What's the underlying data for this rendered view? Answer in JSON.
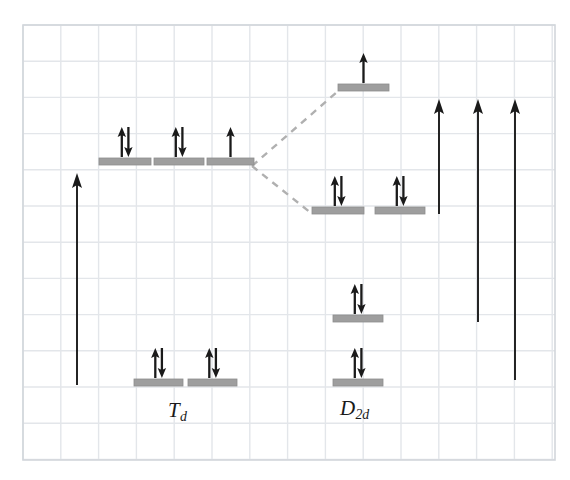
{
  "figure": {
    "kind": "orbital-energy-level-correlation-diagram",
    "background_color": "#ffffff",
    "grid": {
      "visible": true,
      "line_color": "#e3e6ea",
      "border_color": "#d2d6db",
      "x_start": 23,
      "y_start": 25,
      "x_end": 555,
      "y_end": 460,
      "cell_width": 37.8,
      "cell_height": 36.2
    },
    "level_color": "#9e9e9e",
    "level_edge_color": "#8d8d8d",
    "arrow_color": "#1a1a1a",
    "dashed_color": "#b0b0b0"
  },
  "labels": [
    {
      "name": "label-td",
      "symbol": "T",
      "subscript": "d",
      "text": "Td",
      "x": 168,
      "y": 398
    },
    {
      "name": "label-d2d",
      "symbol": "D",
      "subscript": "2d",
      "text": "D2d",
      "x": 340,
      "y": 396
    }
  ],
  "levels": [
    {
      "name": "td-upper-1",
      "group": "Td",
      "set": "upper",
      "x": 99,
      "y": 165,
      "width": 52,
      "electrons": 2,
      "spin": "paired"
    },
    {
      "name": "td-upper-2",
      "group": "Td",
      "set": "upper",
      "x": 154,
      "y": 165,
      "width": 50,
      "electrons": 2,
      "spin": "paired"
    },
    {
      "name": "td-upper-3",
      "group": "Td",
      "set": "upper",
      "x": 207,
      "y": 165,
      "width": 47,
      "electrons": 1,
      "spin": "single-up"
    },
    {
      "name": "td-lower-1",
      "group": "Td",
      "set": "lower",
      "x": 134,
      "y": 386,
      "width": 49,
      "electrons": 2,
      "spin": "paired"
    },
    {
      "name": "td-lower-2",
      "group": "Td",
      "set": "lower",
      "x": 188,
      "y": 386,
      "width": 49,
      "electrons": 2,
      "spin": "paired"
    },
    {
      "name": "d2d-top-1",
      "group": "D2d",
      "set": "top",
      "x": 338,
      "y": 91,
      "width": 51,
      "electrons": 1,
      "spin": "single-up"
    },
    {
      "name": "d2d-mid-1",
      "group": "D2d",
      "set": "mid",
      "x": 312,
      "y": 214,
      "width": 52,
      "electrons": 2,
      "spin": "paired"
    },
    {
      "name": "d2d-mid-2",
      "group": "D2d",
      "set": "mid",
      "x": 375,
      "y": 214,
      "width": 50,
      "electrons": 2,
      "spin": "paired"
    },
    {
      "name": "d2d-low-1",
      "group": "D2d",
      "set": "low",
      "x": 333,
      "y": 322,
      "width": 50,
      "electrons": 2,
      "spin": "paired"
    },
    {
      "name": "d2d-low-2",
      "group": "D2d",
      "set": "low",
      "x": 333,
      "y": 386,
      "width": 50,
      "electrons": 2,
      "spin": "paired"
    }
  ],
  "correlation_lines": [
    {
      "name": "correlation-line-up",
      "x1": 252,
      "y1": 166,
      "x2": 337,
      "y2": 92,
      "style": "dashed"
    },
    {
      "name": "correlation-line-down",
      "x1": 252,
      "y1": 166,
      "x2": 311,
      "y2": 213,
      "style": "dashed"
    }
  ],
  "transition_arrows": [
    {
      "name": "transition-arrow-td",
      "x": 77,
      "y_tail": 385,
      "y_head": 173
    },
    {
      "name": "transition-arrow-d2d-1",
      "x": 439,
      "y_tail": 214,
      "y_head": 99
    },
    {
      "name": "transition-arrow-d2d-2",
      "x": 478,
      "y_tail": 322,
      "y_head": 99
    },
    {
      "name": "transition-arrow-d2d-3",
      "x": 515,
      "y_tail": 380,
      "y_head": 99
    }
  ]
}
